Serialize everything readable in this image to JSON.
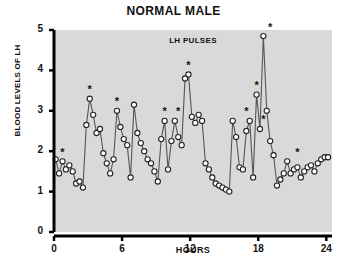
{
  "chart_data": {
    "type": "line",
    "title": "NORMAL MALE",
    "annotation": "LH PULSES",
    "xlabel": "HOURS",
    "ylabel": "BLOOD LEVELS OF LH",
    "xlim": [
      0,
      24.5
    ],
    "ylim": [
      0,
      5
    ],
    "xticks": [
      0,
      6,
      12,
      18,
      24
    ],
    "xtick_labels": [
      "0",
      "6",
      "12",
      "18",
      "24"
    ],
    "yticks": [
      0,
      1,
      2,
      3,
      4,
      5
    ],
    "ytick_labels": [
      "0",
      "1",
      "2",
      "3",
      "4",
      "5"
    ],
    "grid": false,
    "legend": null,
    "marker": "open-circle",
    "series": [
      {
        "name": "LH",
        "x": [
          0.15,
          0.45,
          0.75,
          1.05,
          1.35,
          1.65,
          1.95,
          2.25,
          2.55,
          2.85,
          3.15,
          3.45,
          3.75,
          4.05,
          4.35,
          4.65,
          4.95,
          5.25,
          5.55,
          5.85,
          6.15,
          6.45,
          6.75,
          7.05,
          7.35,
          7.65,
          7.95,
          8.25,
          8.55,
          8.85,
          9.15,
          9.45,
          9.75,
          10.05,
          10.35,
          10.65,
          10.95,
          11.25,
          11.55,
          11.85,
          12.15,
          12.45,
          12.75,
          13.05,
          13.35,
          13.65,
          13.95,
          14.25,
          14.55,
          14.85,
          15.15,
          15.45,
          15.75,
          16.05,
          16.35,
          16.65,
          16.95,
          17.25,
          17.55,
          17.85,
          18.15,
          18.45,
          18.75,
          19.05,
          19.35,
          19.65,
          19.95,
          20.25,
          20.55,
          20.85,
          21.15,
          21.45,
          21.75,
          22.05,
          22.35,
          22.65,
          22.95,
          23.25,
          23.55,
          23.85,
          24.15
        ],
        "y": [
          1.8,
          1.45,
          1.75,
          1.55,
          1.65,
          1.5,
          1.2,
          1.25,
          1.1,
          2.65,
          3.3,
          2.9,
          2.45,
          2.55,
          1.95,
          1.7,
          1.45,
          1.8,
          3.0,
          2.6,
          2.3,
          2.15,
          1.35,
          3.15,
          2.45,
          2.2,
          2.0,
          1.8,
          1.7,
          1.5,
          1.25,
          2.3,
          2.75,
          1.55,
          2.25,
          2.75,
          2.35,
          2.15,
          3.8,
          3.9,
          2.85,
          2.7,
          2.9,
          2.75,
          1.7,
          1.55,
          1.35,
          1.2,
          1.15,
          1.1,
          1.05,
          1.0,
          2.75,
          2.35,
          1.6,
          1.55,
          2.5,
          2.75,
          1.35,
          3.4,
          2.55,
          4.85,
          3.0,
          2.25,
          1.9,
          1.15,
          1.3,
          1.45,
          1.75,
          1.45,
          1.55,
          1.6,
          1.35,
          1.5,
          1.6,
          1.65,
          1.5,
          1.7,
          1.8,
          1.85,
          1.85
        ]
      }
    ],
    "pulse_markers": {
      "symbol": "*",
      "points": [
        {
          "x": 0.75,
          "y": 1.75
        },
        {
          "x": 3.15,
          "y": 3.3
        },
        {
          "x": 5.55,
          "y": 3.0
        },
        {
          "x": 9.75,
          "y": 2.75
        },
        {
          "x": 10.95,
          "y": 2.75
        },
        {
          "x": 11.85,
          "y": 3.9
        },
        {
          "x": 16.95,
          "y": 2.75
        },
        {
          "x": 18.45,
          "y": 2.55
        },
        {
          "x": 17.85,
          "y": 3.4
        },
        {
          "x": 19.05,
          "y": 4.85
        },
        {
          "x": 21.45,
          "y": 1.75
        }
      ]
    },
    "colors": {
      "plot_background": "#d9d9d9",
      "axis": "#000000",
      "line": "#555555",
      "marker_fill": "#ffffff",
      "marker_edge": "#222222",
      "text": "#111111"
    }
  }
}
